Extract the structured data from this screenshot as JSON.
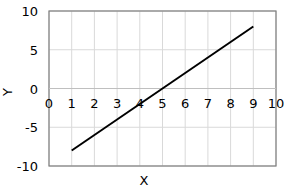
{
  "chart_data": {
    "type": "line",
    "title": "",
    "xlabel": "X",
    "ylabel": "Y",
    "xlim": [
      0,
      10
    ],
    "ylim": [
      -10,
      10
    ],
    "x_ticks": [
      "0",
      "1",
      "2",
      "3",
      "4",
      "5",
      "6",
      "7",
      "8",
      "9",
      "10"
    ],
    "y_ticks": [
      "10",
      "5",
      "0",
      "-5",
      "-10"
    ],
    "grid": true,
    "legend": null,
    "series": [
      {
        "name": "y = 2x - 10",
        "x": [
          1,
          9
        ],
        "y": [
          -8,
          8
        ],
        "color": "#000000"
      }
    ]
  }
}
